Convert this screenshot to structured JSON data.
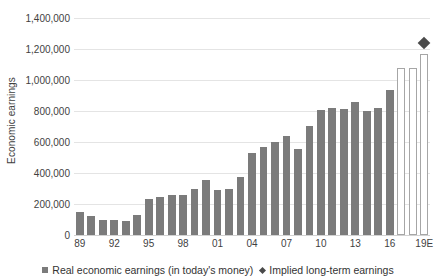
{
  "chart_data": {
    "type": "bar",
    "title": "",
    "xlabel": "",
    "ylabel": "Economic earnings",
    "ylim": [
      0,
      1400000
    ],
    "ytick_values": [
      0,
      200000,
      400000,
      600000,
      800000,
      1000000,
      1200000,
      1400000
    ],
    "ytick_labels": [
      "0",
      "200,000",
      "400,000",
      "600,000",
      "800,000",
      "1,000,000",
      "1,200,000",
      "1,400,000"
    ],
    "grid": true,
    "legend_position": "bottom",
    "categories": [
      "89",
      "90",
      "91",
      "92",
      "93",
      "94",
      "95",
      "96",
      "97",
      "98",
      "99",
      "00",
      "01",
      "02",
      "03",
      "04",
      "05",
      "06",
      "07",
      "08",
      "09",
      "10",
      "11",
      "12",
      "13",
      "14",
      "15",
      "16",
      "17E",
      "18E",
      "19E"
    ],
    "xtick_labels": [
      "89",
      "92",
      "95",
      "98",
      "01",
      "04",
      "07",
      "10",
      "13",
      "16",
      "19E"
    ],
    "xtick_indices": [
      0,
      3,
      6,
      9,
      12,
      15,
      18,
      21,
      24,
      27,
      30
    ],
    "series": [
      {
        "name": "Real economic earnings (in today's money)",
        "type": "bar",
        "color": "#7b7b7b",
        "style": "solid",
        "values": [
          150000,
          120000,
          95000,
          100000,
          92000,
          130000,
          235000,
          245000,
          260000,
          258000,
          295000,
          355000,
          290000,
          300000,
          375000,
          530000,
          565000,
          600000,
          640000,
          555000,
          705000,
          805000,
          820000,
          815000,
          860000,
          800000,
          820000,
          935000,
          null,
          null,
          null
        ]
      },
      {
        "name": "Estimated economic earnings",
        "type": "bar",
        "color": "#ffffff",
        "style": "hollow",
        "border_color": "#a6a6a6",
        "values": [
          null,
          null,
          null,
          null,
          null,
          null,
          null,
          null,
          null,
          null,
          null,
          null,
          null,
          null,
          null,
          null,
          null,
          null,
          null,
          null,
          null,
          null,
          null,
          null,
          null,
          null,
          null,
          null,
          1080000,
          1080000,
          1170000
        ]
      },
      {
        "name": "Implied long-term earnings",
        "type": "scatter",
        "marker": "diamond",
        "color": "#4a4a4a",
        "points": [
          {
            "index": 30,
            "value": 1240000
          }
        ]
      }
    ],
    "legend_entries": [
      {
        "label": "Real economic earnings (in today's money)",
        "marker": "square",
        "color": "#7b7b7b"
      },
      {
        "label": "Implied long-term earnings",
        "marker": "diamond",
        "color": "#4a4a4a"
      }
    ]
  }
}
